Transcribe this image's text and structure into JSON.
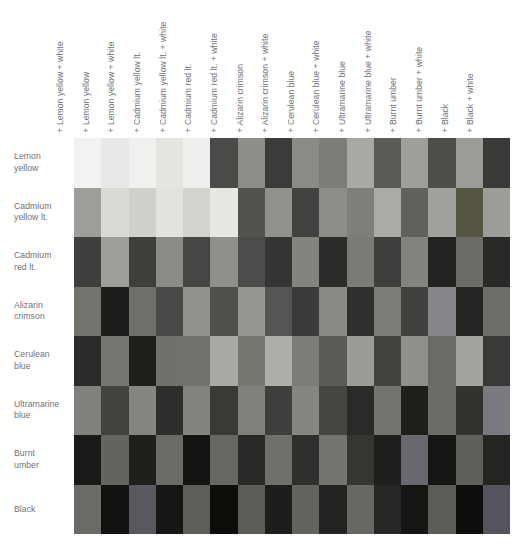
{
  "chart_data": {
    "type": "heatmap",
    "title": "",
    "xlabel": "",
    "ylabel": "",
    "grid": false,
    "legend_position": "none",
    "columns": [
      "+ Lemon yellow + white",
      "+ Lemon yellow",
      "+ Lemon yellow + white",
      "+ Cadmium yellow lt.",
      "+ Cadmium yellow lt. + white",
      "+ Cadmium red lt.",
      "+ Cadmium red lt. + white",
      "+ Alizarin crimson",
      "+ Alizarin crimson + white",
      "+ Cerulean blue",
      "+ Cerulean blue + white",
      "+ Ultramarine blue",
      "+ Ultramarine blue + white",
      "+ Burnt umber",
      "+ Burnt umber + white",
      "+ Black",
      "+ Black + white"
    ],
    "rows": [
      [
        "Lemon",
        "yellow"
      ],
      [
        "Cadmium",
        "yellow lt."
      ],
      [
        "Cadmium",
        "red lt."
      ],
      [
        "Alizarin",
        "crimson"
      ],
      [
        "Cerulean",
        "blue"
      ],
      [
        "Ultramarine",
        "blue"
      ],
      [
        "Burnt",
        "umber"
      ],
      [
        "Black",
        ""
      ]
    ],
    "row_names": [
      "Lemon yellow",
      "Cadmium yellow lt.",
      "Cadmium red lt.",
      "Alizarin crimson",
      "Cerulean blue",
      "Ultramarine blue",
      "Burnt umber",
      "Black"
    ],
    "values": [
      [
        "#f2f2f0",
        "#e8e8e6",
        "#f0f0ee",
        "#e4e4e1",
        "#efefed",
        "#4b4a48",
        "#8d8d8a",
        "#3c3b39",
        "#8a8a87",
        "#7c7c79",
        "#a9a9a6",
        "#5b5a57",
        "#9e9e9b",
        "#4f4e4b",
        "#9b9b98",
        "#3a3937",
        "#9d9d9a"
      ],
      [
        "#d9d9d6",
        "#cfcfcc",
        "#e2e2df",
        "#d2d2cf",
        "#e6e6e3",
        "#53524f",
        "#90908d",
        "#434240",
        "#8c8c89",
        "#7e7e7b",
        "#aaaaa7",
        "#61605d",
        "#a0a09d",
        "#565542",
        "#9c9c99",
        "#403f3d",
        "#9e9e9b"
      ],
      [
        "#3f3e3c",
        "#8a8a87",
        "#474644",
        "#8f8f8c",
        "#4d4c4a",
        "#353432",
        "#838380",
        "#2d2c2a",
        "#7a7a77",
        "#3f3e3c",
        "#84847f",
        "#232220",
        "#6b6b68",
        "#2a2927",
        "#74746f",
        "#1d1c1a",
        "#6e6e6b"
      ],
      [
        "#4a4947",
        "#91918e",
        "#504f4d",
        "#969693",
        "#565553",
        "#3b3a38",
        "#888885",
        "#302f2d",
        "#7c7c79",
        "#424140",
        "#86868a",
        "#262523",
        "#6d6d6a",
        "#2c2b29",
        "#767672",
        "#1f1e1c",
        "#70706d"
      ],
      [
        "#72726f",
        "#a8a8a5",
        "#76766f",
        "#adadaa",
        "#7c7c79",
        "#5b5a57",
        "#9a9a97",
        "#44433f",
        "#8f8f8c",
        "#6a6a67",
        "#a3a3a0",
        "#3a3937",
        "#80807d",
        "#43423f",
        "#858582",
        "#2f2e2c",
        "#838380"
      ],
      [
        "#3a3937",
        "#80807d",
        "#413f3d",
        "#858582",
        "#46453f",
        "#2b2a28",
        "#74746f",
        "#1f1e1c",
        "#6b6b68",
        "#33322f",
        "#79797f",
        "#1a1917",
        "#636360",
        "#201f1d",
        "#6a6a67",
        "#151413",
        "#666663"
      ],
      [
        "#2a2927",
        "#6f6f6c",
        "#302f2d",
        "#747471",
        "#36352f",
        "#201f1d",
        "#68686f",
        "#161513",
        "#5f5f5c",
        "#252422",
        "#6a6a67",
        "#121110",
        "#58585f",
        "#171614",
        "#5e5e5b",
        "#0e0d0c",
        "#5b5b58"
      ],
      [
        "#1e1d1b",
        "#62625f",
        "#232220",
        "#676764",
        "#282725",
        "#161513",
        "#5c5c59",
        "#0f0e0d",
        "#54545f",
        "#191816",
        "#5d5d5a",
        "#0c0b0a",
        "#4e4e4b",
        "#100f0e",
        "#535350",
        "#08070f",
        "#515150"
      ]
    ]
  },
  "footer": {
    "note": ""
  }
}
